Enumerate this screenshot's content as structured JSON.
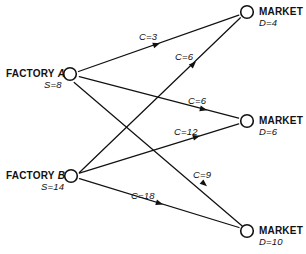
{
  "diagram": {
    "stroke_color": "#111111",
    "background_color": "#ffffff",
    "nodes": [
      {
        "id": "factory-a",
        "kind": "factory",
        "name_prefix": "FACTORY",
        "name_suffix": "A",
        "label": "FACTORY A",
        "sub_label": "S=8",
        "supply": 8,
        "cx": 70,
        "cy": 74
      },
      {
        "id": "factory-b",
        "kind": "factory",
        "name_prefix": "FACTORY",
        "name_suffix": "B",
        "label": "FACTORY B",
        "sub_label": "S=14",
        "supply": 14,
        "cx": 71,
        "cy": 176
      },
      {
        "id": "market-1",
        "kind": "market",
        "name_prefix": "MARKET",
        "name_suffix": "I",
        "label": "MARKET I",
        "sub_label": "D=4",
        "demand": 4,
        "cx": 247,
        "cy": 12
      },
      {
        "id": "market-2",
        "kind": "market",
        "name_prefix": "MARKET",
        "name_suffix": "II",
        "label": "MARKET II",
        "sub_label": "D=6",
        "demand": 6,
        "cx": 247,
        "cy": 121
      },
      {
        "id": "market-3",
        "kind": "market",
        "name_prefix": "MARKET",
        "name_suffix": "III",
        "label": "MARKET III",
        "sub_label": "D=10",
        "demand": 10,
        "cx": 247,
        "cy": 231
      }
    ],
    "edges": [
      {
        "id": "edge-a-1",
        "from": "factory-a",
        "to": "market-1",
        "label": "C=3",
        "cost": 3,
        "label_x": 139,
        "label_y": 31
      },
      {
        "id": "edge-b-1",
        "from": "factory-b",
        "to": "market-1",
        "label": "C=6",
        "cost": 6,
        "label_x": 175,
        "label_y": 51
      },
      {
        "id": "edge-a-2",
        "from": "factory-a",
        "to": "market-2",
        "label": "C=6",
        "cost": 6,
        "label_x": 188,
        "label_y": 95
      },
      {
        "id": "edge-b-2",
        "from": "factory-b",
        "to": "market-2",
        "label": "C=12",
        "cost": 12,
        "label_x": 174,
        "label_y": 126
      },
      {
        "id": "edge-a-3",
        "from": "factory-a",
        "to": "market-3",
        "label": "C=9",
        "cost": 9,
        "label_x": 193,
        "label_y": 169
      },
      {
        "id": "edge-b-3",
        "from": "factory-b",
        "to": "market-3",
        "label": "C=18",
        "cost": 18,
        "label_x": 131,
        "label_y": 190
      }
    ]
  }
}
